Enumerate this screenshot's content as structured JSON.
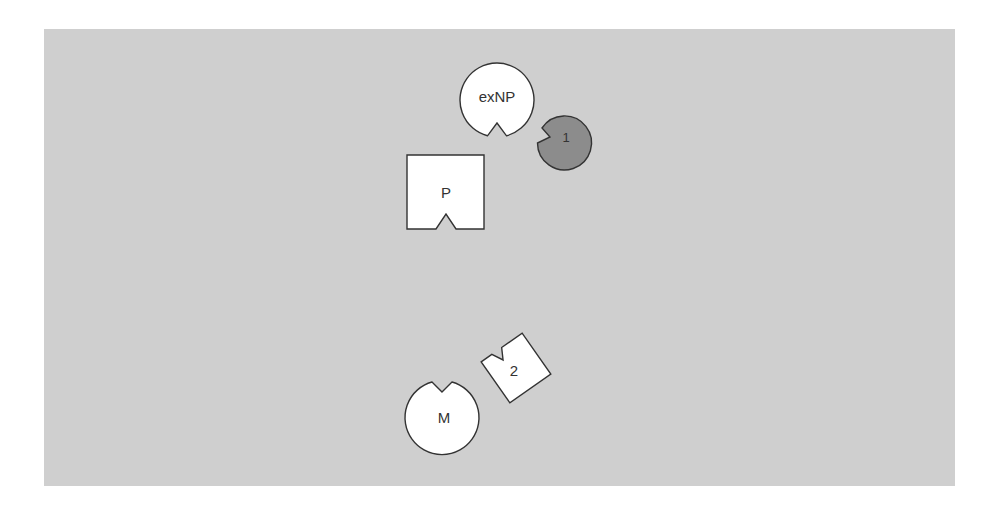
{
  "diagram": {
    "background_color": "#cfcfcf",
    "page_color": "#ffffff",
    "outline_color": "#333333",
    "shapes": [
      {
        "id": "exNP",
        "label": "exNP",
        "kind": "notched-circle",
        "fill": "#ffffff",
        "notch": "bottom"
      },
      {
        "id": "ligand-1",
        "label": "1",
        "kind": "notched-circle",
        "fill": "#8c8c8c",
        "notch": "left"
      },
      {
        "id": "P",
        "label": "P",
        "kind": "notched-square",
        "fill": "#ffffff",
        "notch": "bottom"
      },
      {
        "id": "ligand-2",
        "label": "2",
        "kind": "notched-square-rotated",
        "fill": "#ffffff",
        "notch": "top"
      },
      {
        "id": "M",
        "label": "M",
        "kind": "notched-circle",
        "fill": "#ffffff",
        "notch": "top"
      }
    ]
  }
}
